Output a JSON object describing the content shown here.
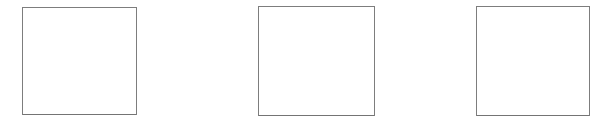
{
  "canvas": {
    "width": 613,
    "height": 127,
    "background_color": "#ffffff"
  },
  "content": {
    "description": "Three empty rectangular outline boxes on a plain white background",
    "box_count": 3
  },
  "boxes": [
    {
      "label": "box-1",
      "x": 22,
      "y": 7,
      "width": 115,
      "height": 108,
      "border_color": "#7d7d7d",
      "border_width": 1,
      "fill_color": "#ffffff",
      "text": ""
    },
    {
      "label": "box-2",
      "x": 258,
      "y": 6,
      "width": 117,
      "height": 110,
      "border_color": "#7d7d7d",
      "border_width": 1,
      "fill_color": "#ffffff",
      "text": ""
    },
    {
      "label": "box-3",
      "x": 476,
      "y": 6,
      "width": 114,
      "height": 110,
      "border_color": "#7d7d7d",
      "border_width": 1,
      "fill_color": "#ffffff",
      "text": ""
    }
  ]
}
